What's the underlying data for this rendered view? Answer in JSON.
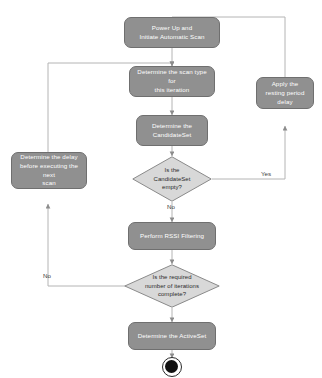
{
  "diagram": {
    "colors": {
      "node_fill": "#909090",
      "node_border": "#6f6f6f",
      "node_text": "#ffffff",
      "decision_fill": "#d8d8d8",
      "decision_border": "#8a8a8a",
      "decision_text": "#2b2b2b",
      "edge": "#9a9a9a",
      "background": "#ffffff",
      "end_marker": "#111111"
    },
    "nodes": [
      {
        "id": "start",
        "type": "process",
        "label": "Power Up and\nInitiate Automatic Scan"
      },
      {
        "id": "scan_type",
        "type": "process",
        "label": "Determine the scan type for\nthis iteration"
      },
      {
        "id": "candidate_set",
        "type": "process",
        "label": "Determine the\nCandidateSet"
      },
      {
        "id": "resting_delay",
        "type": "process",
        "label": "Apply the\nresting period\ndelay"
      },
      {
        "id": "next_scan_delay",
        "type": "process",
        "label": "Determine the delay\nbefore executing the next\nscan"
      },
      {
        "id": "rssi_filter",
        "type": "process",
        "label": "Perform RSSI Filtering"
      },
      {
        "id": "active_set",
        "type": "process",
        "label": "Determine the ActiveSet"
      },
      {
        "id": "decision_candidate",
        "type": "decision",
        "label": "Is the\nCandidateSet\nempty?"
      },
      {
        "id": "decision_iterations",
        "type": "decision",
        "label": "Is the required\nnumber of iterations\ncomplete?"
      },
      {
        "id": "end",
        "type": "terminator",
        "label": ""
      }
    ],
    "edge_labels": {
      "candidate_yes": "Yes",
      "candidate_no": "No",
      "iterations_no": "No"
    }
  }
}
